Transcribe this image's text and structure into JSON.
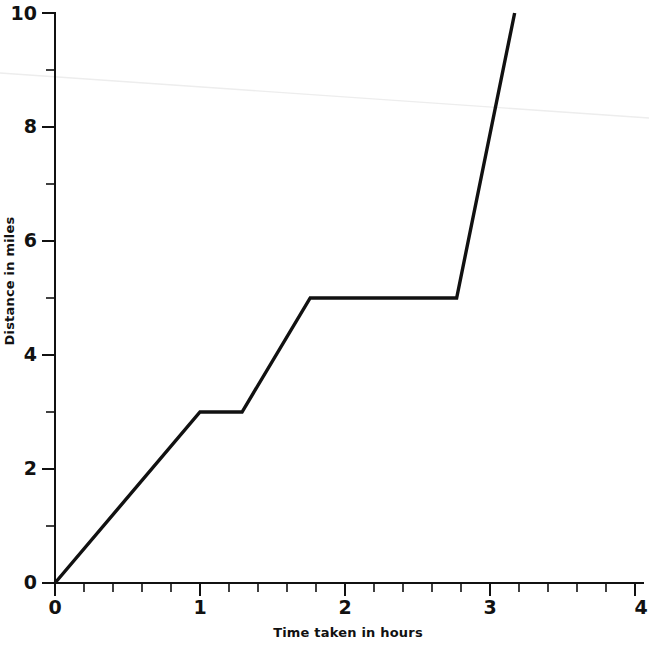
{
  "chart_data": {
    "type": "line",
    "title": "",
    "subtitle": "",
    "xlabel": "Time taken in hours",
    "ylabel": "Distance in miles",
    "xlim": [
      0,
      4
    ],
    "ylim": [
      0,
      10
    ],
    "grid": false,
    "legend": false,
    "legend_position": "none",
    "x_major_ticks": [
      0,
      1,
      2,
      3,
      4
    ],
    "x_major_tick_labels": [
      "0",
      "1",
      "2",
      "3",
      "4"
    ],
    "x_minor_tick_step": 0.2,
    "y_major_ticks": [
      0,
      2,
      4,
      6,
      8,
      10
    ],
    "y_major_tick_labels": [
      "0",
      "2",
      "4",
      "6",
      "8",
      "10"
    ],
    "y_minor_ticks": [
      1,
      3,
      5,
      7,
      9
    ],
    "series": [
      {
        "name": "journey",
        "color": "#111111",
        "x": [
          0,
          1.0,
          1.29,
          1.76,
          2.77,
          3.17
        ],
        "y": [
          0,
          3.0,
          3.0,
          5.0,
          5.0,
          10.0
        ]
      }
    ],
    "annotations": [
      {
        "name": "scan-artifact-streak",
        "color": "#ededed",
        "x_pixels": [
          0,
          649
        ],
        "y_pixels": [
          73,
          118
        ]
      }
    ]
  },
  "axes": {
    "x_title": "Time taken in hours",
    "y_title": "Distance in miles"
  },
  "y_labels": {
    "t0": "0",
    "t2": "2",
    "t4": "4",
    "t6": "6",
    "t8": "8",
    "t10": "10"
  },
  "x_labels": {
    "t0": "0",
    "t1": "1",
    "t2": "2",
    "t3": "3",
    "t4": "4"
  }
}
